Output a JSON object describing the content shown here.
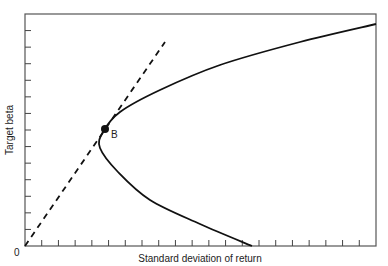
{
  "chart_data": {
    "type": "line",
    "title": "",
    "xlabel": "Standard deviation of return",
    "ylabel": "Target beta",
    "origin_label": "0",
    "point_label": "B",
    "x_ticks": 21,
    "y_ticks": 14,
    "tick_labels": [],
    "series": [
      {
        "name": "Efficient frontier (target beta vs std dev)",
        "style": "solid",
        "shape": "hyperbola opening right",
        "points": [
          [
            252,
            246
          ],
          [
            200,
            224
          ],
          [
            150,
            200
          ],
          [
            118,
            172
          ],
          [
            100,
            148
          ],
          [
            103,
            132
          ],
          [
            120,
            112
          ],
          [
            160,
            90
          ],
          [
            220,
            65
          ],
          [
            300,
            42
          ],
          [
            376,
            24
          ]
        ]
      },
      {
        "name": "Tangent line from origin",
        "style": "dashed",
        "points": [
          [
            25,
            246
          ],
          [
            165,
            42
          ]
        ]
      }
    ],
    "annotations": [
      {
        "label": "B",
        "x": 105,
        "y": 129,
        "note": "tangency point"
      }
    ],
    "frame": {
      "left": 25,
      "top": 14,
      "right": 376,
      "bottom": 246
    },
    "grid": false,
    "legend": "none"
  }
}
